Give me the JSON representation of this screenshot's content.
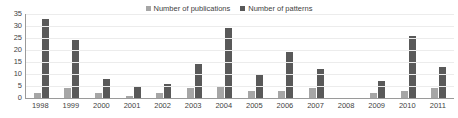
{
  "chart_data": {
    "type": "bar",
    "title": "",
    "xlabel": "",
    "ylabel": "",
    "ylim": [
      0,
      35
    ],
    "ytick_step": 5,
    "yticks": [
      35,
      30,
      25,
      20,
      15,
      10,
      5,
      0
    ],
    "grid": true,
    "legend_position": "top-center",
    "categories": [
      "1998",
      "1999",
      "2000",
      "2001",
      "2002",
      "2003",
      "2004",
      "2005",
      "2006",
      "2007",
      "2008",
      "2009",
      "2010",
      "2011"
    ],
    "series": [
      {
        "name": "Number of publications",
        "color": "#a6a6a6",
        "values": [
          2,
          4,
          2,
          1,
          2,
          4,
          5,
          3,
          3,
          4,
          0,
          2,
          3,
          4
        ]
      },
      {
        "name": "Number of patterns",
        "color": "#595959",
        "values": [
          33,
          24,
          8,
          5,
          6,
          14,
          29,
          10,
          19,
          12,
          0,
          7,
          26,
          13
        ]
      }
    ]
  },
  "legend": {
    "items": [
      {
        "label": "Number of publications",
        "color": "#a6a6a6"
      },
      {
        "label": "Number of patterns",
        "color": "#595959"
      }
    ]
  }
}
